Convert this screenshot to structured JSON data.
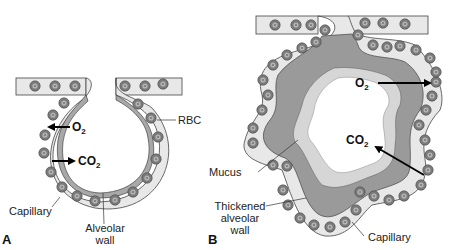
{
  "figure": {
    "colors": {
      "capillary_fill": "#e8e8e8",
      "rbc_outer": "#7a7a7a",
      "rbc_inner": "#b0b0b0",
      "alveolar_wall": "#a8a8a8",
      "thickened_wall": "#9a9a9a",
      "mucus": "#d6d6d6",
      "outline": "#444444",
      "arrow": "#000000"
    },
    "panel_a": {
      "letter": "A",
      "labels": {
        "rbc": "RBC",
        "capillary": "Capillary",
        "alveolar_wall_line1": "Alveolar",
        "alveolar_wall_line2": "wall"
      },
      "gases": {
        "o2_main": "O",
        "o2_sub": "2",
        "co2_main": "CO",
        "co2_sub": "2"
      }
    },
    "panel_b": {
      "letter": "B",
      "labels": {
        "mucus": "Mucus",
        "thickened_line1": "Thickened",
        "thickened_line2": "alveolar",
        "thickened_line3": "wall",
        "capillary": "Capillary"
      },
      "gases": {
        "o2_main": "O",
        "o2_sub": "2",
        "co2_main": "CO",
        "co2_sub": "2"
      }
    }
  }
}
